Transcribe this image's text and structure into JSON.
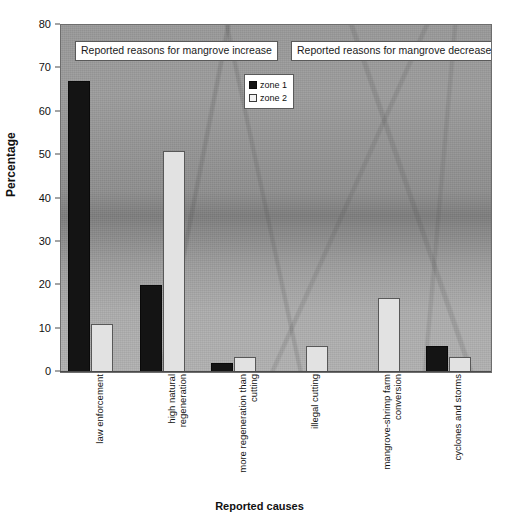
{
  "chart_data": {
    "type": "bar",
    "title": "",
    "xlabel": "Reported causes",
    "ylabel": "Percentage",
    "ylim": [
      0,
      80
    ],
    "yticks": [
      0,
      10,
      20,
      30,
      40,
      50,
      60,
      70,
      80
    ],
    "grid": false,
    "legend_position": "top-center",
    "categories": [
      "law enforcement",
      "high natural\nregeneration",
      "more regeneration than\ncutting",
      "illegal cutting",
      "mangrove-shrimp farm\nconversion",
      "cyclones and storms"
    ],
    "series": [
      {
        "name": "zone 1",
        "color": "#141414",
        "values": [
          67,
          20,
          2,
          0,
          0,
          6
        ]
      },
      {
        "name": "zone 2",
        "color": "#e2e2e2",
        "values": [
          11,
          51,
          3.5,
          6,
          17,
          3.5
        ]
      }
    ],
    "annotations": [
      {
        "text": "Reported reasons for mangrove increase",
        "spans_categories": [
          0,
          2
        ]
      },
      {
        "text": "Reported reasons for mangrove decrease",
        "spans_categories": [
          3,
          5
        ]
      }
    ]
  },
  "legend": {
    "items": [
      {
        "label": "zone 1",
        "swatch": "filled-black-square"
      },
      {
        "label": "zone 2",
        "swatch": "open-white-square"
      }
    ]
  },
  "axes": {
    "y_title": "Percentage",
    "x_title": "Reported causes",
    "y_tick_labels": [
      "0",
      "10",
      "20",
      "30",
      "40",
      "50",
      "60",
      "70",
      "80"
    ]
  }
}
